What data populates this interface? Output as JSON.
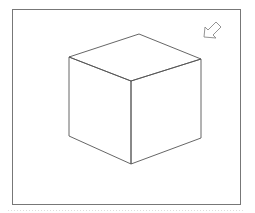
{
  "diagram": {
    "frame": {
      "x": 12.5,
      "y": 9.5,
      "width": 228,
      "height": 195,
      "stroke": "#777777"
    },
    "cube": {
      "stroke": "#555555",
      "vertices": {
        "back_top": [
          139,
          34
        ],
        "left_top": [
          69,
          57
        ],
        "right_top": [
          201,
          59
        ],
        "front_top": [
          131,
          81
        ],
        "left_bottom": [
          69,
          136
        ],
        "front_bottom": [
          131,
          164
        ],
        "right_bottom": [
          201,
          138
        ]
      }
    },
    "arrow": {
      "icon": "arrow-down-left-icon",
      "direction": "down-left",
      "stroke": "#888888"
    },
    "bottom_rule": {
      "style": "dotted",
      "color": "#dddddd"
    }
  }
}
